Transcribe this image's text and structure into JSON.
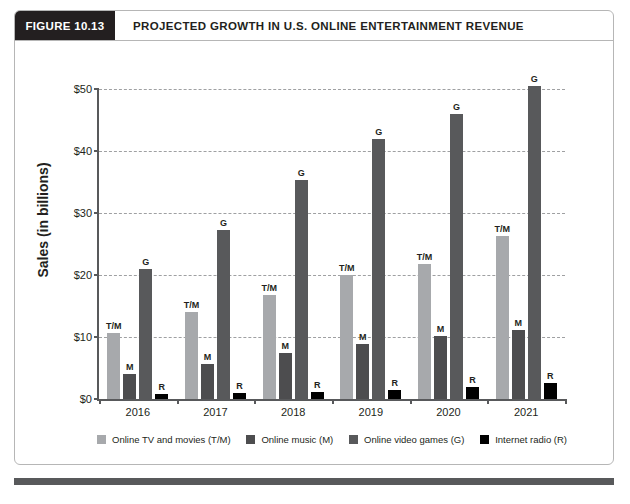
{
  "figure": {
    "tag": "FIGURE 10.13",
    "title": "PROJECTED GROWTH IN U.S. ONLINE ENTERTAINMENT REVENUE"
  },
  "colors": {
    "tv_movies": "#a7a9ac",
    "music": "#4d4d4f",
    "games": "#58595b",
    "radio": "#000000",
    "axis": "#58595b",
    "grid": "#9fa0a2",
    "header_bg": "#231f20",
    "border": "#b6b6b6"
  },
  "chart_data": {
    "type": "bar",
    "title": "PROJECTED GROWTH IN U.S. ONLINE ENTERTAINMENT REVENUE",
    "xlabel": "",
    "ylabel": "Sales (in billions)",
    "ylim": [
      0,
      50
    ],
    "yticks": [
      0,
      10,
      20,
      30,
      40,
      50
    ],
    "ytick_labels": [
      "$0",
      "$10",
      "$20",
      "$30",
      "$40",
      "$50"
    ],
    "grid": true,
    "legend_position": "bottom",
    "categories": [
      "2016",
      "2017",
      "2018",
      "2019",
      "2020",
      "2021"
    ],
    "series": [
      {
        "name": "Online TV and movies (T/M)",
        "short": "T/M",
        "color": "#a7a9ac",
        "values": [
          10.7,
          14.0,
          16.8,
          20.0,
          21.8,
          26.3
        ]
      },
      {
        "name": "Online music (M)",
        "short": "M",
        "color": "#4d4d4f",
        "values": [
          4.0,
          5.7,
          7.5,
          8.9,
          10.2,
          11.2
        ]
      },
      {
        "name": "Online video games (G)",
        "short": "G",
        "color": "#58595b",
        "values": [
          21.0,
          27.3,
          35.4,
          42.0,
          46.0,
          50.5
        ]
      },
      {
        "name": "Internet radio (R)",
        "short": "R",
        "color": "#000000",
        "values": [
          0.8,
          0.9,
          1.1,
          1.4,
          2.0,
          2.6
        ]
      }
    ]
  }
}
